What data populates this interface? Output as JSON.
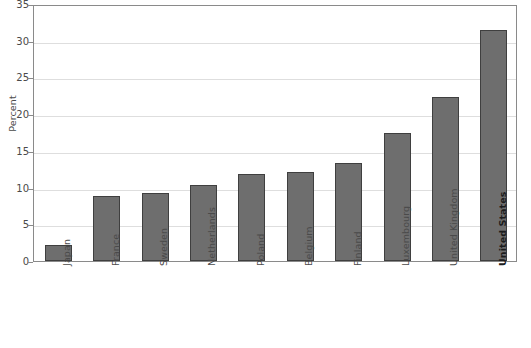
{
  "chart_data": {
    "type": "bar",
    "title": "",
    "subtitle": "",
    "xlabel": "",
    "ylabel": "Percent",
    "ylim": [
      0,
      35
    ],
    "yticks": [
      0,
      5,
      10,
      15,
      20,
      25,
      30,
      35
    ],
    "grid": true,
    "legend": false,
    "legend_position": "none",
    "categories": [
      "Japan",
      "France",
      "Sweden",
      "Netherlands",
      "Poland",
      "Belgium",
      "Finland",
      "Luxembourg",
      "United Kingdom",
      "United States"
    ],
    "values": [
      2.2,
      8.9,
      9.2,
      10.3,
      11.9,
      12.1,
      13.4,
      17.5,
      22.3,
      31.5
    ],
    "highlighted_category": "United States",
    "bar_color": "#6e6e6e",
    "bar_border_color": "#3f3f3f",
    "grid_color": "#dedede",
    "axis_color": "#8a8a8a",
    "text_color": "#4a4a4a"
  }
}
